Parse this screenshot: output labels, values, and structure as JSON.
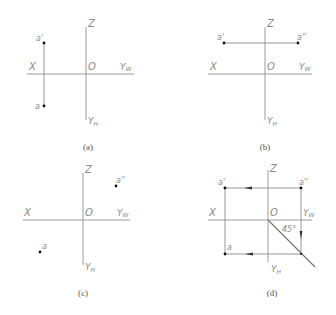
{
  "figure": {
    "panels": [
      {
        "id": "a",
        "caption": "(a)",
        "axes": {
          "x": "X",
          "origin": "O",
          "z": "Z",
          "yw": "YW",
          "yh": "YH"
        },
        "points": {
          "front": "a'",
          "top": "a"
        }
      },
      {
        "id": "b",
        "caption": "(b)",
        "axes": {
          "x": "X",
          "origin": "O",
          "z": "Z",
          "yw": "YW",
          "yh": "YH"
        },
        "points": {
          "front": "a'",
          "side": "a''"
        }
      },
      {
        "id": "c",
        "caption": "(c)",
        "axes": {
          "x": "X",
          "origin": "O",
          "z": "Z",
          "yw": "YW",
          "yh": "YH"
        },
        "points": {
          "side": "a''",
          "top": "a"
        }
      },
      {
        "id": "d",
        "caption": "(d)",
        "axes": {
          "x": "X",
          "origin": "O",
          "z": "Z",
          "yw": "YW",
          "yh": "YH"
        },
        "points": {
          "front": "a'",
          "side": "a''",
          "top": "a"
        },
        "angle_label": "45°"
      }
    ],
    "colors": {
      "axis": "#9a9a9a",
      "point": "#111111",
      "label": "#8a8a8a"
    }
  }
}
